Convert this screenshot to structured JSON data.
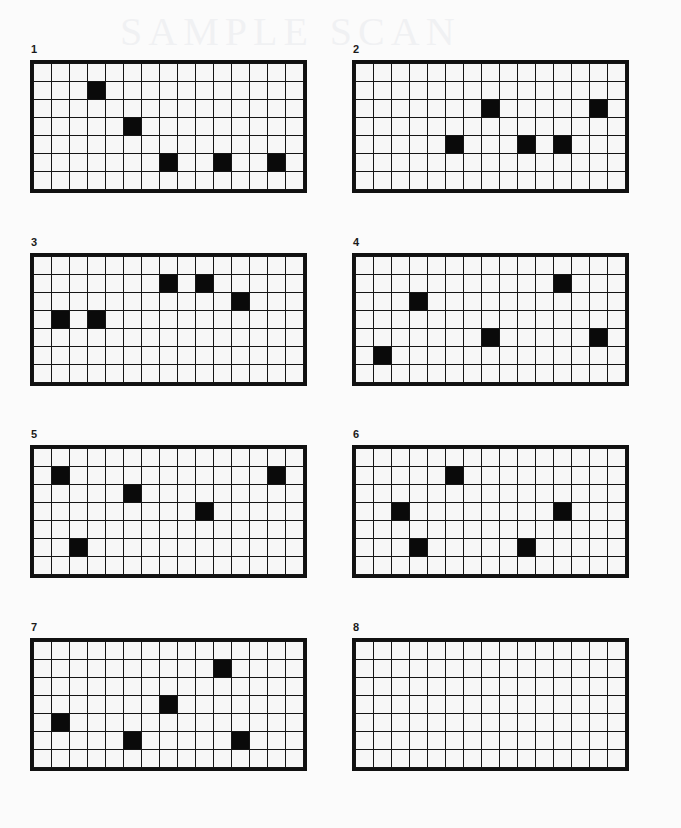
{
  "page": {
    "background_color": "#fbfbfb",
    "grid_line_color": "#151515",
    "filled_cell_color": "#0a0a0a",
    "watermark_text": "SAMPLE SCAN"
  },
  "grid_spec": {
    "columns": 15,
    "rows": 7,
    "cell_size_px": 19
  },
  "panels": [
    {
      "label": "1",
      "columns": 15,
      "rows": 7,
      "filled_count": 5,
      "filled_cells": [
        {
          "row": 2,
          "col": 4
        },
        {
          "row": 4,
          "col": 6
        },
        {
          "row": 6,
          "col": 8
        },
        {
          "row": 6,
          "col": 11
        },
        {
          "row": 6,
          "col": 14
        }
      ]
    },
    {
      "label": "2",
      "columns": 15,
      "rows": 7,
      "filled_count": 5,
      "filled_cells": [
        {
          "row": 3,
          "col": 8
        },
        {
          "row": 3,
          "col": 14
        },
        {
          "row": 5,
          "col": 6
        },
        {
          "row": 5,
          "col": 10
        },
        {
          "row": 5,
          "col": 12
        }
      ]
    },
    {
      "label": "3",
      "columns": 15,
      "rows": 7,
      "filled_count": 5,
      "filled_cells": [
        {
          "row": 2,
          "col": 8
        },
        {
          "row": 2,
          "col": 10
        },
        {
          "row": 3,
          "col": 12
        },
        {
          "row": 4,
          "col": 2
        },
        {
          "row": 4,
          "col": 4
        }
      ]
    },
    {
      "label": "4",
      "columns": 15,
      "rows": 7,
      "filled_count": 5,
      "filled_cells": [
        {
          "row": 2,
          "col": 12
        },
        {
          "row": 3,
          "col": 4
        },
        {
          "row": 5,
          "col": 8
        },
        {
          "row": 5,
          "col": 14
        },
        {
          "row": 6,
          "col": 2
        }
      ]
    },
    {
      "label": "5",
      "columns": 15,
      "rows": 7,
      "filled_count": 5,
      "filled_cells": [
        {
          "row": 2,
          "col": 2
        },
        {
          "row": 2,
          "col": 14
        },
        {
          "row": 3,
          "col": 6
        },
        {
          "row": 4,
          "col": 10
        },
        {
          "row": 6,
          "col": 3
        }
      ]
    },
    {
      "label": "6",
      "columns": 15,
      "rows": 7,
      "filled_count": 5,
      "filled_cells": [
        {
          "row": 2,
          "col": 6
        },
        {
          "row": 4,
          "col": 3
        },
        {
          "row": 4,
          "col": 12
        },
        {
          "row": 6,
          "col": 4
        },
        {
          "row": 6,
          "col": 10
        }
      ]
    },
    {
      "label": "7",
      "columns": 15,
      "rows": 7,
      "filled_count": 5,
      "filled_cells": [
        {
          "row": 2,
          "col": 11
        },
        {
          "row": 4,
          "col": 8
        },
        {
          "row": 5,
          "col": 2
        },
        {
          "row": 6,
          "col": 6
        },
        {
          "row": 6,
          "col": 12
        }
      ]
    },
    {
      "label": "8",
      "columns": 15,
      "rows": 7,
      "filled_count": 0,
      "filled_cells": []
    }
  ]
}
